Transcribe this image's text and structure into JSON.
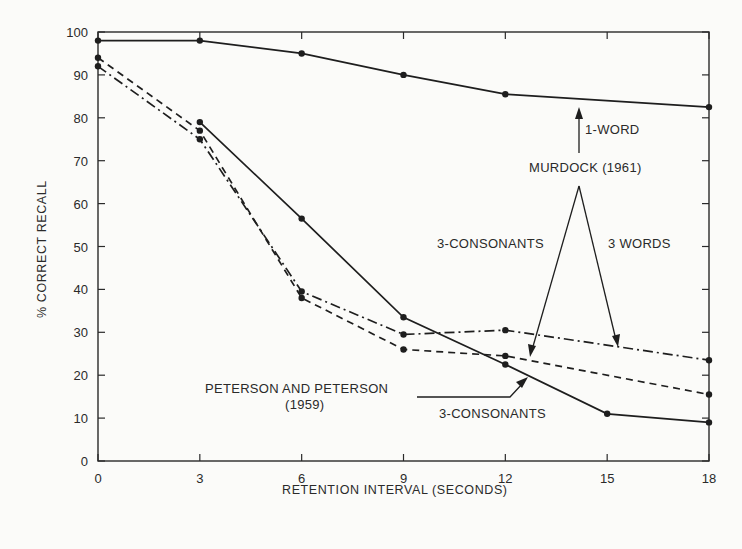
{
  "chart_data": {
    "type": "line",
    "title": "",
    "xlabel": "RETENTION INTERVAL (SECONDS)",
    "ylabel": "% CORRECT RECALL",
    "xlim": [
      0,
      18
    ],
    "ylim": [
      0,
      100
    ],
    "xticks": [
      0,
      3,
      6,
      9,
      12,
      15,
      18
    ],
    "yticks": [
      0,
      10,
      20,
      30,
      40,
      50,
      60,
      70,
      80,
      90,
      100
    ],
    "grid": false,
    "frame": "box",
    "series": [
      {
        "name": "Murdock (1961) 1-word",
        "style": "solid",
        "x": [
          0,
          3,
          6,
          9,
          12,
          18
        ],
        "y": [
          98,
          98,
          95,
          90,
          85.5,
          82.5
        ]
      },
      {
        "name": "Peterson and Peterson (1959) 3-consonants",
        "style": "solid",
        "x": [
          3,
          6,
          9,
          12,
          15,
          18
        ],
        "y": [
          79,
          56.5,
          33.5,
          22.5,
          11,
          9
        ]
      },
      {
        "name": "Murdock (1961) 3-consonants",
        "style": "dashed",
        "x": [
          0,
          3,
          6,
          9,
          12,
          18
        ],
        "y": [
          94,
          77,
          38,
          26,
          24.5,
          15.5
        ]
      },
      {
        "name": "Murdock (1961) 3 words",
        "style": "dashdot",
        "x": [
          0,
          3,
          6,
          9,
          12,
          18
        ],
        "y": [
          92,
          75,
          39.5,
          29.5,
          30.5,
          23.5
        ]
      }
    ],
    "annotations": [
      {
        "text": "1-WORD",
        "x": 14.3,
        "y": 71
      },
      {
        "text": "MURDOCK (1961)",
        "x": 12.6,
        "y": 67
      },
      {
        "text": "3-CONSONANTS",
        "x": 9.6,
        "y": 50
      },
      {
        "text": "3 WORDS",
        "x": 14.8,
        "y": 50
      },
      {
        "text": "PETERSON AND PETERSON",
        "x": 3.1,
        "y": 17
      },
      {
        "text": "(1959)",
        "x": 5.7,
        "y": 13
      },
      {
        "text": "3-CONSONANTS",
        "x": 9.7,
        "y": 12
      }
    ]
  },
  "labels": {
    "annot_1word": "1-WORD",
    "annot_murdock": "MURDOCK (1961)",
    "annot_3cons_top": "3-CONSONANTS",
    "annot_3words": "3 WORDS",
    "annot_peterson": "PETERSON AND PETERSON",
    "annot_peterson_year": "(1959)",
    "annot_3cons_bottom": "3-CONSONANTS"
  }
}
